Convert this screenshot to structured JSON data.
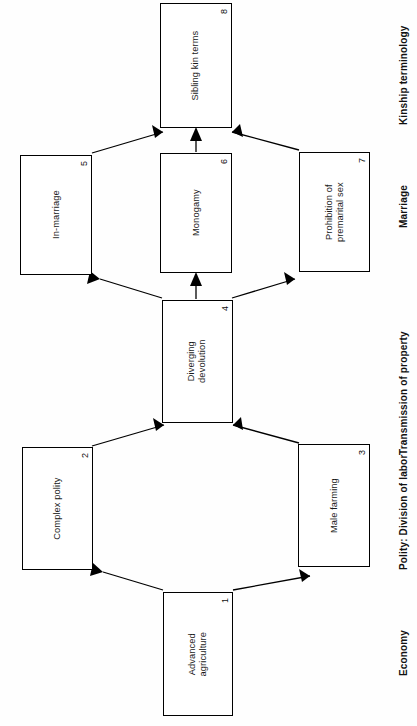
{
  "figure": {
    "type": "flow-diagram",
    "orientation": "rotated-90-ccw",
    "background_color": "#ffffff",
    "line_color": "#000000"
  },
  "nodes": [
    {
      "id": "1",
      "number": "1",
      "label": "Advanced\nagriculture",
      "column": "Economy"
    },
    {
      "id": "2",
      "number": "2",
      "label": "Complex polity",
      "column": "Polity: Division of labor"
    },
    {
      "id": "3",
      "number": "3",
      "label": "Male farming",
      "column": "Polity: Division of labor"
    },
    {
      "id": "4",
      "number": "4",
      "label": "Diverging\ndevolution",
      "column": "Transmission of property"
    },
    {
      "id": "5",
      "number": "5",
      "label": "In-marriage",
      "column": "Marriage"
    },
    {
      "id": "6",
      "number": "6",
      "label": "Monogamy",
      "column": "Marriage"
    },
    {
      "id": "7",
      "number": "7",
      "label": "Prohibition of\npremarital sex",
      "column": "Marriage"
    },
    {
      "id": "8",
      "number": "8",
      "label": "Sibling kin terms",
      "column": "Kinship terminology"
    }
  ],
  "columns": [
    {
      "id": "economy",
      "label": "Economy"
    },
    {
      "id": "polity",
      "label": "Polity: Division of labor"
    },
    {
      "id": "property",
      "label": "Transmission of property"
    },
    {
      "id": "marriage",
      "label": "Marriage"
    },
    {
      "id": "kinship",
      "label": "Kinship terminology"
    }
  ],
  "edges": [
    {
      "from": "1",
      "to": "2",
      "arrow": "single"
    },
    {
      "from": "1",
      "to": "3",
      "arrow": "single"
    },
    {
      "from": "2",
      "to": "4",
      "arrow": "single"
    },
    {
      "from": "3",
      "to": "4",
      "arrow": "single"
    },
    {
      "from": "4",
      "to": "5",
      "arrow": "single"
    },
    {
      "from": "4",
      "to": "6",
      "arrow": "single"
    },
    {
      "from": "4",
      "to": "7",
      "arrow": "single"
    },
    {
      "from": "5",
      "to": "8",
      "arrow": "single"
    },
    {
      "from": "6",
      "to": "8",
      "arrow": "single"
    },
    {
      "from": "7",
      "to": "8",
      "arrow": "single"
    }
  ]
}
